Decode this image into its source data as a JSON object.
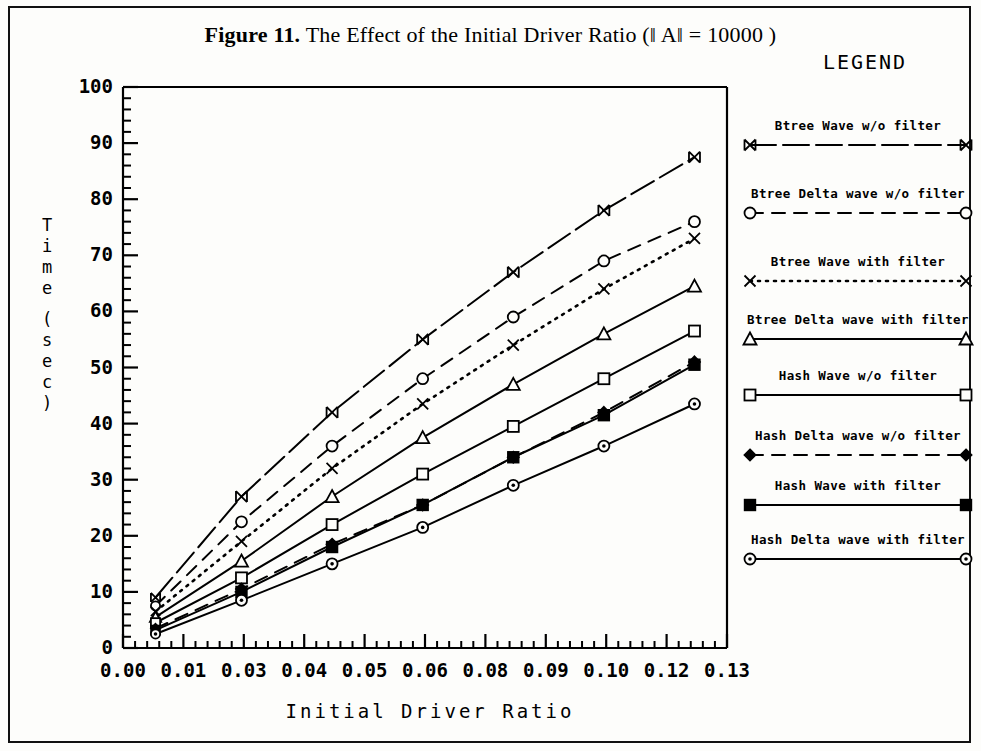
{
  "figure": {
    "number_label": "Figure 11.",
    "caption": "The Effect of the Initial Driver Ratio (‖ A‖ = 10000 )"
  },
  "legend": {
    "heading": "LEGEND",
    "entries": [
      {
        "label": "Btree Wave w/o filter",
        "marker": "bowtie",
        "line": "long-dash"
      },
      {
        "label": "Btree Delta wave w/o filter",
        "marker": "circle",
        "line": "dashed"
      },
      {
        "label": "Btree Wave with filter",
        "marker": "x",
        "line": "dotted"
      },
      {
        "label": "Btree Delta wave with filter",
        "marker": "triangle",
        "line": "solid"
      },
      {
        "label": "Hash Wave w/o filter",
        "marker": "square",
        "line": "solid"
      },
      {
        "label": "Hash Delta wave w/o filter",
        "marker": "diamond",
        "line": "dashed"
      },
      {
        "label": "Hash Wave with filter",
        "marker": "filled-square",
        "line": "solid"
      },
      {
        "label": "Hash Delta wave with filter",
        "marker": "circle-dot",
        "line": "solid"
      }
    ]
  },
  "axes": {
    "y_label_chars": [
      "T",
      "i",
      "m",
      "e",
      "",
      "(",
      "s",
      "e",
      "c",
      ")"
    ],
    "y_label_text": "Time (sec)",
    "x_label": "Initial Driver Ratio",
    "x_ticklabels": [
      "0.00",
      "0.01",
      "0.03",
      "0.04",
      "0.05",
      "0.06",
      "0.08",
      "0.09",
      "0.10",
      "0.12",
      "0.13"
    ],
    "y_ticklabels": [
      "0",
      "10",
      "20",
      "30",
      "40",
      "50",
      "60",
      "70",
      "80",
      "90",
      "100"
    ],
    "y_min": 0,
    "y_max": 100,
    "y_major_step": 10,
    "y_minor_per_major": 5,
    "x_minor_per_major": 5
  },
  "colors": {
    "ink": "#000000",
    "paper": "#fdfdfb"
  },
  "chart_data": {
    "type": "line",
    "title": "Figure 11. The Effect of the Initial Driver Ratio (‖ A‖ = 10000 )",
    "xlabel": "Initial Driver Ratio",
    "ylabel": "Time (sec)",
    "xlim": [
      0.0,
      0.13
    ],
    "ylim": [
      0,
      100
    ],
    "grid": false,
    "legend_position": "right",
    "x": [
      0.007,
      0.0255,
      0.045,
      0.0645,
      0.084,
      0.1035,
      0.123
    ],
    "x_ticklabels": [
      "0.00",
      "0.01",
      "0.03",
      "0.04",
      "0.05",
      "0.06",
      "0.08",
      "0.09",
      "0.10",
      "0.12",
      "0.13"
    ],
    "series": [
      {
        "name": "Btree Wave w/o filter",
        "marker": "bowtie",
        "line": "long-dash",
        "values": [
          9,
          27,
          42,
          55,
          67,
          78,
          87.5
        ]
      },
      {
        "name": "Btree Delta wave w/o filter",
        "marker": "circle",
        "line": "dashed",
        "values": [
          7.5,
          22.5,
          36,
          48,
          59,
          69,
          76
        ]
      },
      {
        "name": "Btree Wave with filter",
        "marker": "x",
        "line": "dotted",
        "values": [
          6.5,
          19,
          32,
          43.5,
          54,
          64,
          73
        ]
      },
      {
        "name": "Btree Delta wave with filter",
        "marker": "triangle",
        "line": "solid",
        "values": [
          5.5,
          15.5,
          27,
          37.5,
          47,
          56,
          64.5
        ]
      },
      {
        "name": "Hash Wave w/o filter",
        "marker": "square",
        "line": "solid",
        "values": [
          4.5,
          12.5,
          22,
          31,
          39.5,
          48,
          56.5
        ]
      },
      {
        "name": "Hash Delta wave w/o filter",
        "marker": "diamond",
        "line": "dashed",
        "values": [
          3.5,
          10.5,
          18.5,
          25.5,
          34,
          42,
          51
        ]
      },
      {
        "name": "Hash Wave with filter",
        "marker": "filled-square",
        "line": "solid",
        "values": [
          3.2,
          10,
          18,
          25.5,
          34,
          41.5,
          50.5
        ]
      },
      {
        "name": "Hash Delta wave with filter",
        "marker": "circle-dot",
        "line": "solid",
        "values": [
          2.5,
          8.5,
          15,
          21.5,
          29,
          36,
          43.5
        ]
      }
    ]
  }
}
